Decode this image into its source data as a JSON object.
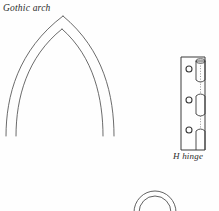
{
  "figure": {
    "background_color": "#fefefe",
    "stroke_color": "#4a4a4a",
    "stroke_color_dark": "#2b2b2b",
    "width": 219,
    "height": 211
  },
  "labels": {
    "gothic_arch": "Gothic arch",
    "h_hinge": "H hinge"
  },
  "drawings": {
    "gothic_arch": {
      "name": "Gothic arch",
      "description": "Two-ply pointed arch, apex at top center, legs cropped at lower edge",
      "apex_outer_x": 63,
      "apex_outer_y": 16,
      "apex_inner_x": 62,
      "apex_inner_y": 29,
      "leg_left_outer_x": 6,
      "leg_left_inner_x": 16,
      "leg_right_inner_x": 103,
      "leg_right_outer_x": 114,
      "leg_bottom_y": 136
    },
    "h_hinge": {
      "name": "H hinge",
      "description": "Plan view of H hinge: left leaf plate with three screw holes and a knuckle column at right with hidden dotted lines",
      "leaf_left_x": 181,
      "leaf_right_x": 205,
      "leaf_top_y": 57,
      "leaf_bottom_y": 150,
      "screw_hole_count": 3,
      "screw_hole_radius": 3,
      "screw_hole_cx": 189,
      "screw_hole_cy_values": [
        69,
        100,
        130
      ],
      "knuckle_column_x": 198,
      "knuckle_count": 3
    },
    "round_arch": {
      "name": "Round arch",
      "description": "Two concentric semicircular arcs, cropped by the bottom edge of the figure",
      "center_x": 155,
      "center_y": 212,
      "radius_outer": 21,
      "radius_inner": 16
    }
  }
}
